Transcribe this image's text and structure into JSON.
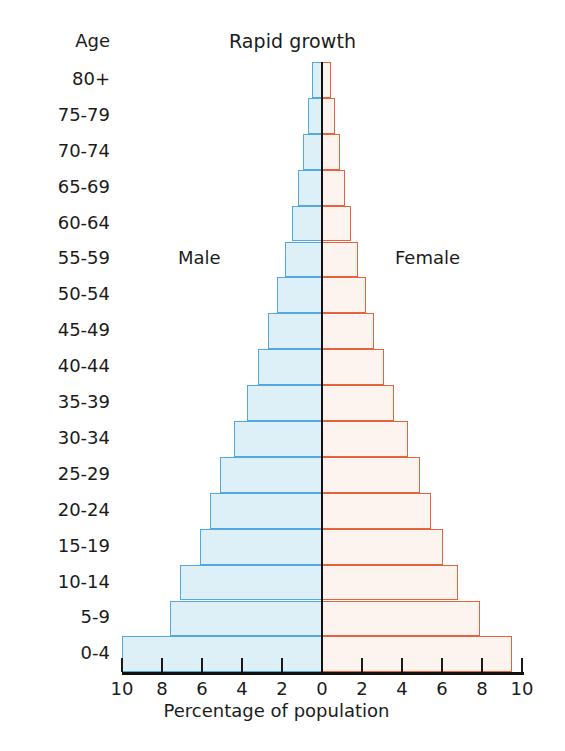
{
  "chart_data": {
    "type": "bar",
    "subtype": "population-pyramid",
    "title": "Rapid growth",
    "xlabel": "Percentage of population",
    "ylabel": "Age",
    "categories": [
      "80+",
      "75-79",
      "70-74",
      "65-69",
      "60-64",
      "55-59",
      "50-54",
      "45-49",
      "40-44",
      "35-39",
      "30-34",
      "25-29",
      "20-24",
      "15-19",
      "10-14",
      "5-9",
      "0-4"
    ],
    "series": [
      {
        "name": "Male",
        "side": "left",
        "color": "#52a9e2",
        "fill": "#ddf0f8",
        "values": [
          0.5,
          0.7,
          0.95,
          1.2,
          1.5,
          1.85,
          2.25,
          2.7,
          3.2,
          3.75,
          4.4,
          5.1,
          5.6,
          6.1,
          7.1,
          7.6,
          10.0
        ]
      },
      {
        "name": "Female",
        "side": "right",
        "color": "#e8623c",
        "fill": "#fdf4ef",
        "values": [
          0.45,
          0.65,
          0.9,
          1.15,
          1.45,
          1.8,
          2.2,
          2.6,
          3.1,
          3.6,
          4.3,
          4.9,
          5.45,
          6.05,
          6.8,
          7.9,
          9.5
        ]
      }
    ],
    "xticks": [
      10,
      8,
      6,
      4,
      2,
      0,
      2,
      4,
      6,
      8,
      10
    ],
    "xlim": [
      -10,
      10
    ],
    "xunit": "percent",
    "grid": false,
    "legend_position": "inline",
    "annotations": [
      {
        "text": "Male",
        "side": "left"
      },
      {
        "text": "Female",
        "side": "right"
      }
    ]
  },
  "labels": {
    "age_header": "Age",
    "male": "Male",
    "female": "Female"
  }
}
